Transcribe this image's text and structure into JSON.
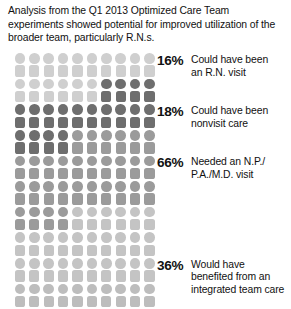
{
  "header": {
    "text": "Analysis from the Q1 2013 Optimized Care Team experiments showed potential for improved utilization of the broader team, particularly R.N.s."
  },
  "colors": {
    "light": "#cfcfcf",
    "lighter": "#c4c4c4",
    "lightest": "#bdbdbd",
    "medium": "#9b9b9b",
    "dark": "#6e6e6e",
    "text": "#111111",
    "background": "#ffffff"
  },
  "legend": [
    {
      "pct": "16%",
      "line1": "Could have been",
      "line2": "an R.N. visit",
      "line3": ""
    },
    {
      "pct": "18%",
      "line1": "Could have been",
      "line2": "nonvisit care",
      "line3": ""
    },
    {
      "pct": "66%",
      "line1": "Needed an N.P./",
      "line2": "P.A./M.D. visit",
      "line3": ""
    },
    {
      "pct": "36%",
      "line1": "Would have",
      "line2": "benefited from an",
      "line3": "integrated team care"
    }
  ],
  "chart_data": {
    "type": "pictogram",
    "title": "Analysis from the Q1 2013 Optimized Care Team experiments showed potential for improved utilization of the broader team, particularly R.N.s.",
    "xlabel": "",
    "ylabel": "",
    "unit": "1 icon = 1 percent of visits",
    "total_icons": 100,
    "rows": 10,
    "columns": 10,
    "grid_on": false,
    "legend_position": "right",
    "categories": [
      "Could have been an R.N. visit",
      "Could have been nonvisit care",
      "Needed an N.P./P.A./M.D. visit",
      "Would have benefited from an integrated team care"
    ],
    "values": [
      16,
      18,
      66,
      36
    ],
    "series": [
      {
        "name": "Could have been an R.N. visit",
        "value": 16,
        "color": "#cfcfcf"
      },
      {
        "name": "Could have been nonvisit care",
        "value": 18,
        "color": "#6e6e6e"
      },
      {
        "name": "Needed an N.P./P.A./M.D. visit",
        "value": 66,
        "color": "#9b9b9b"
      },
      {
        "name": "Would have benefited from an integrated team care",
        "value": 36,
        "color": "#c4c4c4"
      }
    ],
    "annotations": [
      "Percentages overlap and therefore sum to more than 100."
    ],
    "icon_shades": [
      [
        "light",
        "light",
        "light",
        "light",
        "light",
        "light",
        "light",
        "light",
        "light",
        "light"
      ],
      [
        "light",
        "light",
        "light",
        "light",
        "light",
        "light",
        "dark",
        "dark",
        "dark",
        "dark"
      ],
      [
        "dark",
        "dark",
        "dark",
        "dark",
        "dark",
        "dark",
        "dark",
        "dark",
        "dark",
        "dark"
      ],
      [
        "dark",
        "dark",
        "dark",
        "dark",
        "medium",
        "medium",
        "medium",
        "medium",
        "medium",
        "medium"
      ],
      [
        "medium",
        "medium",
        "medium",
        "medium",
        "medium",
        "medium",
        "medium",
        "medium",
        "medium",
        "medium"
      ],
      [
        "medium",
        "medium",
        "medium",
        "medium",
        "medium",
        "medium",
        "medium",
        "medium",
        "medium",
        "medium"
      ],
      [
        "medium",
        "medium",
        "medium",
        "medium",
        "lighter",
        "lighter",
        "lighter",
        "lighter",
        "lighter",
        "lighter"
      ],
      [
        "lighter",
        "lighter",
        "lighter",
        "lighter",
        "lighter",
        "lighter",
        "lighter",
        "lighter",
        "lighter",
        "lighter"
      ],
      [
        "lighter",
        "lighter",
        "lighter",
        "lighter",
        "lighter",
        "lighter",
        "lighter",
        "lighter",
        "lighter",
        "lighter"
      ],
      [
        "lightest",
        "lightest",
        "lightest",
        "lightest",
        "lightest",
        "lightest",
        "lightest",
        "lightest",
        "lightest",
        "lightest"
      ]
    ],
    "label_anchor_rows": [
      0,
      2,
      4,
      8
    ]
  }
}
